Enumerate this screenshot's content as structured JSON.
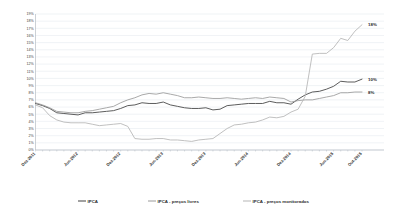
{
  "chart_data": {
    "type": "line",
    "title": "",
    "subtitle": "",
    "xlabel": "",
    "ylabel": "",
    "ylim": [
      0,
      19
    ],
    "ytick_step": 1,
    "grid": true,
    "legend_position": "bottom",
    "yticks": [
      "0%",
      "1%",
      "2%",
      "3%",
      "4%",
      "5%",
      "6%",
      "7%",
      "8%",
      "9%",
      "10%",
      "11%",
      "12%",
      "13%",
      "14%",
      "15%",
      "16%",
      "17%",
      "18%",
      "19%"
    ],
    "xticks": [
      "Dez-2011",
      "Jun-2012",
      "Dez-2012",
      "Jun-2013",
      "Dez-2013",
      "Jun-2014",
      "Dez-2014",
      "Jun-2015",
      "Out-2015"
    ],
    "x_all": [
      "Dez-2011",
      "Jan-2012",
      "Fev-2012",
      "Mar-2012",
      "Abr-2012",
      "Mai-2012",
      "Jun-2012",
      "Jul-2012",
      "Ago-2012",
      "Set-2012",
      "Out-2012",
      "Nov-2012",
      "Dez-2012",
      "Jan-2013",
      "Fev-2013",
      "Mar-2013",
      "Abr-2013",
      "Mai-2013",
      "Jun-2013",
      "Jul-2013",
      "Ago-2013",
      "Set-2013",
      "Out-2013",
      "Nov-2013",
      "Dez-2013",
      "Jan-2014",
      "Fev-2014",
      "Mar-2014",
      "Abr-2014",
      "Mai-2014",
      "Jun-2014",
      "Jul-2014",
      "Ago-2014",
      "Set-2014",
      "Out-2014",
      "Nov-2014",
      "Dez-2014",
      "Jan-2015",
      "Fev-2015",
      "Mar-2015",
      "Abr-2015",
      "Mai-2015",
      "Jun-2015",
      "Jul-2015",
      "Ago-2015",
      "Set-2015",
      "Out-2015"
    ],
    "series": [
      {
        "name": "IPCA",
        "color": "#4a4a4a",
        "width": 0.9,
        "end_label": "10%",
        "values": [
          6.5,
          6.2,
          5.8,
          5.2,
          5.1,
          5.0,
          4.9,
          5.2,
          5.2,
          5.3,
          5.4,
          5.5,
          5.8,
          6.2,
          6.3,
          6.6,
          6.5,
          6.5,
          6.7,
          6.3,
          6.1,
          5.9,
          5.8,
          5.8,
          5.9,
          5.6,
          5.7,
          6.2,
          6.3,
          6.4,
          6.5,
          6.5,
          6.5,
          6.8,
          6.6,
          6.6,
          6.4,
          7.1,
          7.7,
          8.1,
          8.2,
          8.5,
          8.9,
          9.6,
          9.5,
          9.5,
          9.9
        ]
      },
      {
        "name": "IPCA - preços livres",
        "color": "#9a9a9a",
        "width": 0.85,
        "end_label": "8%",
        "values": [
          6.6,
          6.3,
          5.9,
          5.4,
          5.3,
          5.2,
          5.2,
          5.4,
          5.5,
          5.7,
          5.9,
          6.1,
          6.6,
          7.0,
          7.3,
          7.7,
          7.9,
          7.8,
          8.0,
          7.8,
          7.6,
          7.3,
          7.3,
          7.4,
          7.3,
          7.2,
          7.2,
          7.3,
          7.2,
          7.1,
          7.2,
          7.3,
          7.2,
          7.4,
          7.3,
          7.2,
          6.7,
          6.9,
          7.0,
          7.0,
          7.2,
          7.4,
          7.6,
          8.0,
          8.0,
          8.1,
          8.1
        ]
      },
      {
        "name": "IPCA - preços monitorados",
        "color": "#b5b5b5",
        "width": 0.85,
        "end_label": "18%",
        "values": [
          6.3,
          5.9,
          4.8,
          4.2,
          3.9,
          3.8,
          3.8,
          3.8,
          3.6,
          3.4,
          3.5,
          3.6,
          3.7,
          3.3,
          1.6,
          1.5,
          1.5,
          1.6,
          1.6,
          1.4,
          1.4,
          1.3,
          1.2,
          1.4,
          1.5,
          1.6,
          2.3,
          3.0,
          3.5,
          3.6,
          3.8,
          3.9,
          4.2,
          4.6,
          4.5,
          4.7,
          5.3,
          5.7,
          7.5,
          13.4,
          13.5,
          13.5,
          14.3,
          15.6,
          15.3,
          16.6,
          17.5
        ]
      }
    ]
  },
  "legend": {
    "items": [
      {
        "label": "IPCA"
      },
      {
        "label": "IPCA - preços livres"
      },
      {
        "label": "IPCA - preços monitorados"
      }
    ]
  }
}
